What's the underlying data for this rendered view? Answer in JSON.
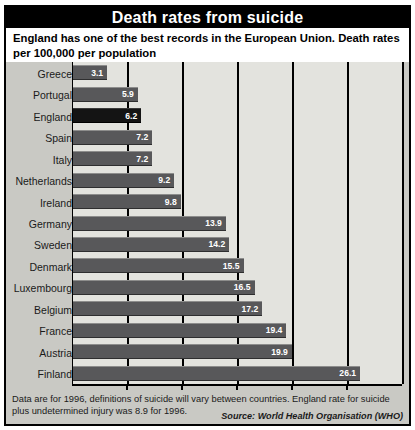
{
  "title": "Death rates from suicide",
  "subtitle": "England has one of the best records in the European Union. Death rates per 100,000 per population",
  "footer": {
    "note": "Data are for 1996, definitions of suicide will vary between countries. England rate for suicide plus undetermined injury was 8.9 for 1996.",
    "source": "Source: World Health Organisation (WHO)"
  },
  "axis": {
    "ticks": [
      "0",
      "5",
      "10",
      "15",
      "20",
      "25",
      "30"
    ]
  },
  "colors": {
    "title_bar": "#000000",
    "title_text": "#ffffff",
    "bar": "#58585a",
    "bar_highlight": "#141414",
    "panel": "#e3e3de",
    "page": "#c9c9c4",
    "value_text": "#ffffff"
  },
  "chart_data": {
    "type": "bar",
    "orientation": "horizontal",
    "title": "Death rates from suicide",
    "subtitle": "England has one of the best records in the European Union. Death rates per 100,000 per population",
    "xlabel": "",
    "ylabel": "",
    "xlim": [
      0,
      30
    ],
    "xticks": [
      0,
      5,
      10,
      15,
      20,
      25,
      30
    ],
    "grid": true,
    "legend": false,
    "highlight": "England",
    "categories": [
      "Greece",
      "Portugal",
      "England",
      "Spain",
      "Italy",
      "Netherlands",
      "Ireland",
      "Germany",
      "Sweden",
      "Denmark",
      "Luxembourg",
      "Belgium",
      "France",
      "Austria",
      "Finland"
    ],
    "values": [
      3.1,
      5.9,
      6.2,
      7.2,
      7.2,
      9.2,
      9.8,
      13.9,
      14.2,
      15.5,
      16.5,
      17.2,
      19.4,
      19.9,
      26.1
    ],
    "value_labels": [
      "3.1",
      "5.9",
      "6.2",
      "7.2",
      "7.2",
      "9.2",
      "9.8",
      "13.9",
      "14.2",
      "15.5",
      "16.5",
      "17.2",
      "19.4",
      "19.9",
      "26.1"
    ]
  }
}
